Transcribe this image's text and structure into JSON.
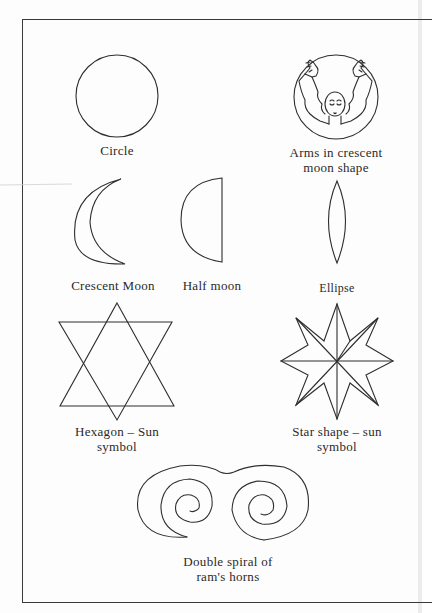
{
  "figure": {
    "stroke_color": "#2e2e2e",
    "background": "#ffffff",
    "symbols": [
      {
        "id": "circle",
        "label": "Circle"
      },
      {
        "id": "arms-crescent",
        "label": "Arms in crescent\nmoon shape"
      },
      {
        "id": "crescent-moon",
        "label": "Crescent Moon"
      },
      {
        "id": "half-moon",
        "label": "Half moon"
      },
      {
        "id": "ellipse",
        "label": "Ellipse"
      },
      {
        "id": "hexagon",
        "label": "Hexagon – Sun\nsymbol"
      },
      {
        "id": "star",
        "label": "Star shape – sun\nsymbol"
      },
      {
        "id": "double-spiral",
        "label": "Double spiral of\nram's horns"
      }
    ]
  }
}
